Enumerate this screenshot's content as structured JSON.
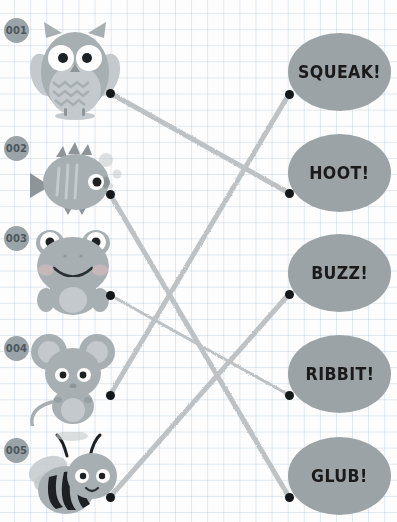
{
  "worksheet": {
    "title": "Animal Sounds Matching Worksheet",
    "grid_color": "#b0c4d4",
    "paper_color": "#fdfdfd",
    "bubble_color": "#9ba3a7",
    "badge_color": "#9aa3a8",
    "line_color": "#b9bec1",
    "dot_color": "#15181a"
  },
  "rows": [
    {
      "badge": "001",
      "animal_name": "owl",
      "dot_left": {
        "x": 110,
        "y": 93
      },
      "sound": "SQUEAK!",
      "bubble_dot": {
        "x": 289,
        "y": 94
      }
    },
    {
      "badge": "002",
      "animal_name": "fish",
      "dot_left": {
        "x": 110,
        "y": 194
      },
      "sound": "HOOT!",
      "bubble_dot": {
        "x": 289,
        "y": 193
      }
    },
    {
      "badge": "003",
      "animal_name": "frog",
      "dot_left": {
        "x": 110,
        "y": 295
      },
      "sound": "BUZZ!",
      "bubble_dot": {
        "x": 289,
        "y": 294
      }
    },
    {
      "badge": "004",
      "animal_name": "mouse",
      "dot_left": {
        "x": 110,
        "y": 395
      },
      "sound": "RIBBIT!",
      "bubble_dot": {
        "x": 289,
        "y": 395
      }
    },
    {
      "badge": "005",
      "animal_name": "bee",
      "dot_left": {
        "x": 110,
        "y": 497
      },
      "sound": "GLUB!",
      "bubble_dot": {
        "x": 289,
        "y": 497
      }
    }
  ],
  "connections": [
    {
      "from_animal": "owl",
      "to_sound": "HOOT!",
      "from": {
        "x": 110,
        "y": 93
      },
      "to": {
        "x": 289,
        "y": 193
      }
    },
    {
      "from_animal": "fish",
      "to_sound": "GLUB!",
      "from": {
        "x": 110,
        "y": 194
      },
      "to": {
        "x": 289,
        "y": 497
      }
    },
    {
      "from_animal": "frog",
      "to_sound": "RIBBIT!",
      "from": {
        "x": 110,
        "y": 295
      },
      "to": {
        "x": 289,
        "y": 395
      }
    },
    {
      "from_animal": "mouse",
      "to_sound": "SQUEAK!",
      "from": {
        "x": 110,
        "y": 395
      },
      "to": {
        "x": 289,
        "y": 94
      }
    },
    {
      "from_animal": "bee",
      "to_sound": "BUZZ!",
      "from": {
        "x": 110,
        "y": 497
      },
      "to": {
        "x": 289,
        "y": 294
      }
    }
  ]
}
